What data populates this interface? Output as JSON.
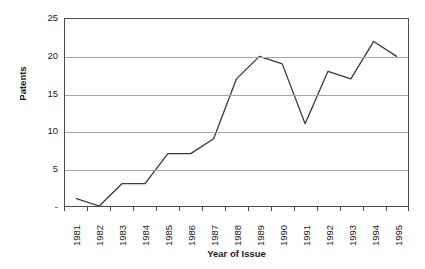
{
  "chart_data": {
    "type": "line",
    "title": "",
    "xlabel": "Year of Issue",
    "ylabel": "Patents",
    "categories": [
      "1981",
      "1982",
      "1983",
      "1984",
      "1985",
      "1986",
      "1987",
      "1988",
      "1989",
      "1990",
      "1991",
      "1992",
      "1993",
      "1994",
      "1995"
    ],
    "values": [
      1,
      0,
      3,
      3,
      7,
      7,
      9,
      17,
      20,
      19,
      11,
      18,
      17,
      22,
      20
    ],
    "series": [
      {
        "name": "Patents",
        "values": [
          1,
          0,
          3,
          3,
          7,
          7,
          9,
          17,
          20,
          19,
          11,
          18,
          17,
          22,
          20
        ]
      }
    ],
    "ylim": [
      0,
      25
    ],
    "ytick_values": [
      0,
      5,
      10,
      15,
      20,
      25
    ],
    "ytick_labels": [
      "-",
      "5",
      "10",
      "15",
      "20",
      "25"
    ],
    "grid": "horizontal",
    "legend": "none",
    "line_color": "#3a3a3a",
    "gridline_color": "#a6a6a6",
    "frame_color": "#4d4d4d",
    "background_color": "#ffffff",
    "text_color": "#1a1a1a",
    "xtick_rotation": 90
  },
  "axes": {
    "y_title": "Patents",
    "x_title": "Year of Issue"
  }
}
